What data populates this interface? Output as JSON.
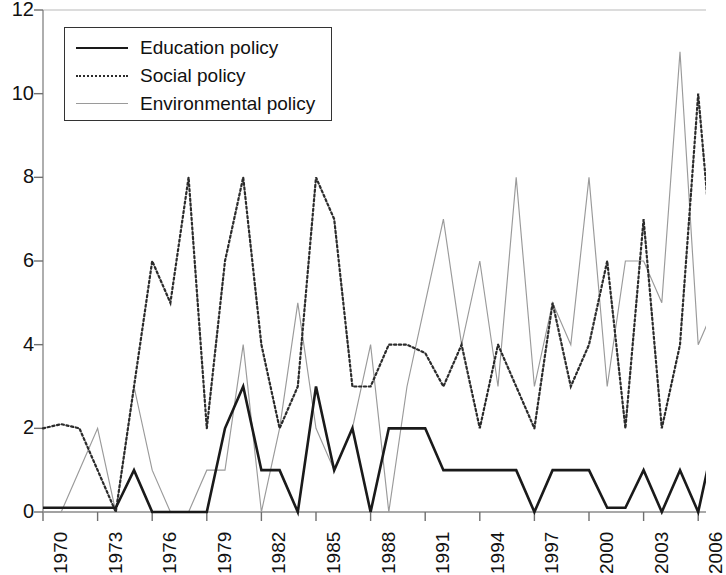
{
  "chart_data": {
    "type": "line",
    "title": "",
    "xlabel": "",
    "ylabel": "",
    "xlim": [
      1970,
      2007
    ],
    "ylim": [
      0,
      12
    ],
    "ytick_values": [
      0,
      2,
      4,
      6,
      8,
      10,
      12
    ],
    "ytick_labels": [
      "0",
      "2",
      "4",
      "6",
      "8",
      "10",
      "12"
    ],
    "xtick_values": [
      1970,
      1973,
      1976,
      1979,
      1982,
      1985,
      1988,
      1991,
      1994,
      1997,
      2000,
      2003,
      2006
    ],
    "xtick_labels": [
      "1970",
      "1973",
      "1976",
      "1979",
      "1982",
      "1985",
      "1988",
      "1991",
      "1994",
      "1997",
      "2000",
      "2003",
      "2006"
    ],
    "grid": false,
    "legend_position": "top-left",
    "x": [
      1970,
      1971,
      1972,
      1973,
      1974,
      1975,
      1976,
      1977,
      1978,
      1979,
      1980,
      1981,
      1982,
      1983,
      1984,
      1985,
      1986,
      1987,
      1988,
      1989,
      1990,
      1991,
      1992,
      1993,
      1994,
      1995,
      1996,
      1997,
      1998,
      1999,
      2000,
      2001,
      2002,
      2003,
      2004,
      2005,
      2006,
      2007
    ],
    "series": [
      {
        "name": "Education policy",
        "style": "solid",
        "color": "#1a1a1a",
        "values": [
          0.1,
          0.1,
          0.1,
          0.1,
          0.1,
          1,
          0,
          0,
          0,
          0,
          2,
          3,
          1,
          1,
          0,
          3,
          1,
          2,
          0,
          2,
          2,
          2,
          1,
          1,
          1,
          1,
          1,
          0,
          1,
          1,
          1,
          0.1,
          0.1,
          1,
          0,
          1,
          0,
          2
        ]
      },
      {
        "name": "Social policy",
        "style": "dotted",
        "color": "#2b2b2b",
        "values": [
          2,
          2.1,
          2,
          1,
          0,
          3,
          6,
          5,
          8,
          2,
          6,
          8,
          4,
          2,
          3,
          8,
          7,
          3,
          3,
          4,
          4,
          3.8,
          3,
          4,
          2,
          4,
          3,
          2,
          5,
          3,
          4,
          6,
          2,
          7,
          2,
          4,
          10,
          5
        ]
      },
      {
        "name": "Environmental policy",
        "style": "thin",
        "color": "#9a9a9a",
        "values": [
          0,
          0,
          1,
          2,
          0,
          3,
          1,
          0,
          0,
          1,
          1,
          4,
          0,
          2,
          5,
          2,
          1,
          2,
          4,
          0,
          3,
          5,
          7,
          4,
          6,
          3,
          8,
          3,
          5,
          4,
          8,
          3,
          6,
          6,
          5,
          11,
          4,
          5
        ]
      }
    ]
  },
  "axes": {
    "legend_entries": [
      {
        "label": "Education policy"
      },
      {
        "label": "Social policy"
      },
      {
        "label": "Environmental policy"
      }
    ]
  }
}
